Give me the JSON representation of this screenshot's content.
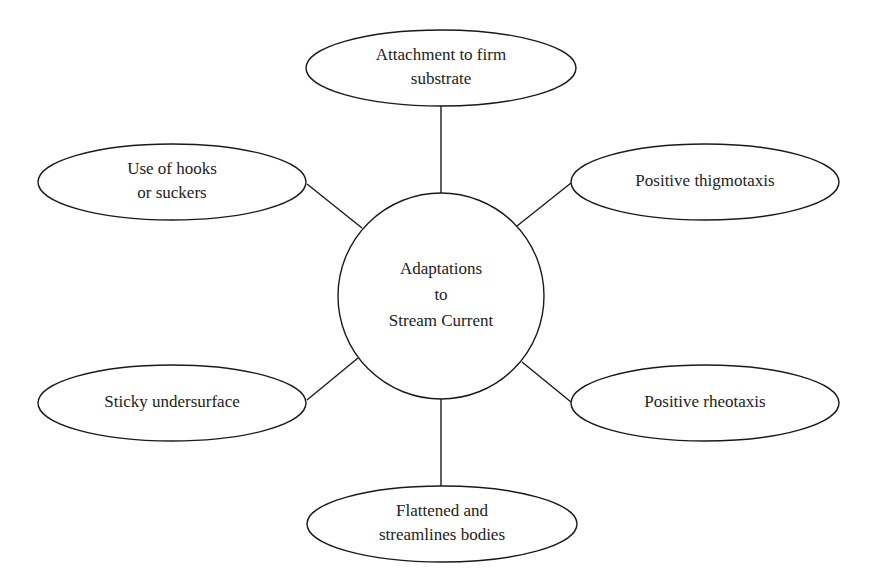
{
  "diagram": {
    "type": "mind-map",
    "center": {
      "id": "center",
      "shape": "circle",
      "lines": [
        "Adaptations",
        "to",
        "Stream Current"
      ],
      "cx": 441,
      "cy": 296,
      "r": 103
    },
    "nodes": [
      {
        "id": "attachment",
        "shape": "ellipse",
        "lines": [
          "Attachment to firm",
          "substrate"
        ],
        "cx": 441,
        "cy": 68,
        "rx": 135,
        "ry": 38,
        "edge": {
          "x1": 441,
          "y1": 106,
          "x2": 441,
          "y2": 193
        }
      },
      {
        "id": "hooks",
        "shape": "ellipse",
        "lines": [
          "Use of hooks",
          "or suckers"
        ],
        "cx": 172,
        "cy": 182,
        "rx": 134,
        "ry": 38,
        "edge": {
          "x1": 307,
          "y1": 184,
          "x2": 362,
          "y2": 228
        }
      },
      {
        "id": "thigmotaxis",
        "shape": "ellipse",
        "lines": [
          "Positive thigmotaxis"
        ],
        "cx": 705,
        "cy": 182,
        "rx": 134,
        "ry": 38,
        "edge": {
          "x1": 571,
          "y1": 183,
          "x2": 517,
          "y2": 226
        }
      },
      {
        "id": "sticky",
        "shape": "ellipse",
        "lines": [
          "Sticky undersurface"
        ],
        "cx": 172,
        "cy": 403,
        "rx": 134,
        "ry": 38,
        "edge": {
          "x1": 307,
          "y1": 400,
          "x2": 358,
          "y2": 358
        }
      },
      {
        "id": "rheotaxis",
        "shape": "ellipse",
        "lines": [
          "Positive rheotaxis"
        ],
        "cx": 705,
        "cy": 403,
        "rx": 134,
        "ry": 38,
        "edge": {
          "x1": 571,
          "y1": 402,
          "x2": 522,
          "y2": 362
        }
      },
      {
        "id": "flattened",
        "shape": "ellipse",
        "lines": [
          "Flattened and",
          "streamlines bodies"
        ],
        "cx": 442,
        "cy": 524,
        "rx": 135,
        "ry": 38,
        "edge": {
          "x1": 441,
          "y1": 399,
          "x2": 441,
          "y2": 486
        }
      }
    ]
  }
}
